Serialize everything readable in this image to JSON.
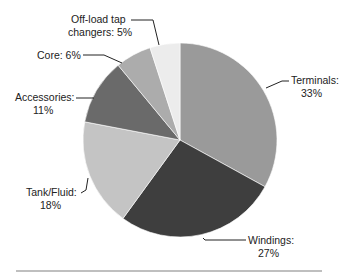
{
  "chart_data": {
    "type": "pie",
    "title": "",
    "start_angle": "12 o'clock",
    "direction": "clockwise",
    "slices": [
      {
        "label": "Terminals",
        "value": 33,
        "color": "#9a9a9a",
        "text1": "Terminals:",
        "text2": "33%"
      },
      {
        "label": "Windings",
        "value": 27,
        "color": "#3e3e3e",
        "text1": "Windings:",
        "text2": "27%"
      },
      {
        "label": "Tank/Fluid",
        "value": 18,
        "color": "#c4c4c4",
        "text1": "Tank/Fluid:",
        "text2": "18%"
      },
      {
        "label": "Accessories",
        "value": 11,
        "color": "#6a6a6a",
        "text1": "Accessories:",
        "text2": "11%"
      },
      {
        "label": "Core",
        "value": 6,
        "color": "#acacac",
        "text1": "Core: 6%",
        "text2": ""
      },
      {
        "label": "Off-load tap changers",
        "value": 5,
        "color": "#ececec",
        "text1": "Off-load tap",
        "text2": "changers: 5%"
      }
    ],
    "unit": "%"
  }
}
